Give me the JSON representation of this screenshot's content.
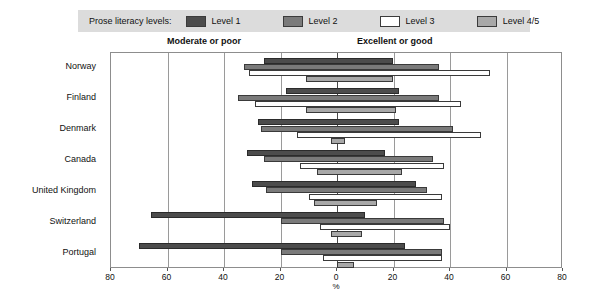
{
  "legend": {
    "title": "Prose literacy levels:",
    "entries": [
      {
        "label": "Level 1",
        "key": "l1",
        "color": "#4c4c4c"
      },
      {
        "label": "Level 2",
        "key": "l2",
        "color": "#7a7a7a"
      },
      {
        "label": "Level 3",
        "key": "l3",
        "color": "#ffffff"
      },
      {
        "label": "Level 4/5",
        "key": "l45",
        "color": "#a8a8a8"
      }
    ]
  },
  "headings": {
    "left": "Moderate or poor",
    "right": "Excellent or good"
  },
  "chart_data": {
    "type": "bar",
    "title": "",
    "subtitle": "",
    "orientation": "horizontal-diverging",
    "xlabel": "%",
    "ylabel": "",
    "xlim": [
      -80,
      80
    ],
    "tick_values": [
      -80,
      -60,
      -40,
      -20,
      0,
      20,
      40,
      60,
      80
    ],
    "tick_labels": [
      "80",
      "60",
      "40",
      "20",
      "0",
      "20",
      "40",
      "60",
      "80"
    ],
    "gridlines": [
      -60,
      -40,
      -20,
      0,
      20,
      40,
      60
    ],
    "grid": true,
    "zero_line": 0,
    "legend_position": "top",
    "categories": [
      "Norway",
      "Finland",
      "Denmark",
      "Canada",
      "United Kingdom",
      "Switzerland",
      "Portugal"
    ],
    "series": [
      {
        "name": "Level 1",
        "key": "l1",
        "ranges": [
          {
            "category": "Norway",
            "left": -26,
            "right": 20
          },
          {
            "category": "Finland",
            "left": -18,
            "right": 22
          },
          {
            "category": "Denmark",
            "left": -28,
            "right": 22
          },
          {
            "category": "Canada",
            "left": -32,
            "right": 17
          },
          {
            "category": "United Kingdom",
            "left": -30,
            "right": 28
          },
          {
            "category": "Switzerland",
            "left": -66,
            "right": 10
          },
          {
            "category": "Portugal",
            "left": -70,
            "right": 24
          }
        ]
      },
      {
        "name": "Level 2",
        "key": "l2",
        "ranges": [
          {
            "category": "Norway",
            "left": -33,
            "right": 36
          },
          {
            "category": "Finland",
            "left": -35,
            "right": 36
          },
          {
            "category": "Denmark",
            "left": -27,
            "right": 41
          },
          {
            "category": "Canada",
            "left": -26,
            "right": 34
          },
          {
            "category": "United Kingdom",
            "left": -25,
            "right": 32
          },
          {
            "category": "Switzerland",
            "left": -20,
            "right": 38
          },
          {
            "category": "Portugal",
            "left": -20,
            "right": 37
          }
        ]
      },
      {
        "name": "Level 3",
        "key": "l3",
        "ranges": [
          {
            "category": "Norway",
            "left": -31,
            "right": 54
          },
          {
            "category": "Finland",
            "left": -29,
            "right": 44
          },
          {
            "category": "Denmark",
            "left": -14,
            "right": 51
          },
          {
            "category": "Canada",
            "left": -13,
            "right": 38
          },
          {
            "category": "United Kingdom",
            "left": -10,
            "right": 37
          },
          {
            "category": "Switzerland",
            "left": -6,
            "right": 40
          },
          {
            "category": "Portugal",
            "left": -5,
            "right": 37
          }
        ]
      },
      {
        "name": "Level 4/5",
        "key": "l45",
        "ranges": [
          {
            "category": "Norway",
            "left": -11,
            "right": 20
          },
          {
            "category": "Finland",
            "left": -11,
            "right": 21
          },
          {
            "category": "Denmark",
            "left": -2,
            "right": 3
          },
          {
            "category": "Canada",
            "left": -7,
            "right": 23
          },
          {
            "category": "United Kingdom",
            "left": -8,
            "right": 14
          },
          {
            "category": "Switzerland",
            "left": -2,
            "right": 9
          },
          {
            "category": "Portugal",
            "left": 0,
            "right": 6
          }
        ]
      }
    ]
  }
}
